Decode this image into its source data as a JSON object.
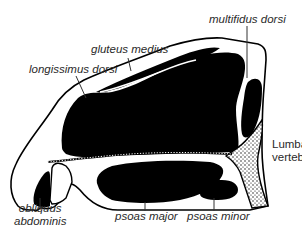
{
  "diagram": {
    "colors": {
      "muscle": "#000000",
      "background": "#ffffff",
      "outline": "#000000",
      "label_text": "#2a2a2a",
      "leader_line": "#333333"
    },
    "labels": {
      "gluteus_medius": "gluteus medius",
      "longissimus_dorsi": "longissimus dorsi",
      "multifidus_dorsi": "multifidus dorsi",
      "lumbar_vertebra_line1": "Lumbar",
      "lumbar_vertebra_line2": "vertebra",
      "obliquus_line1": "obliquus",
      "obliquus_line2": "abdominis",
      "psoas_major": "psoas major",
      "psoas_minor": "psoas minor"
    }
  }
}
